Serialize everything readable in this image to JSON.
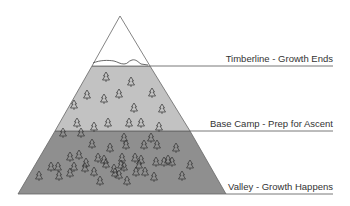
{
  "diagram": {
    "type": "mountain-zones",
    "colors": {
      "peak": "#ffffff",
      "upper_zone": "#c2c2c2",
      "lower_zone": "#8f8f8f",
      "outline": "#555555",
      "tree_stroke": "#333333"
    },
    "zones": [
      {
        "id": "peak",
        "label": ""
      },
      {
        "id": "timberline",
        "label": "Timberline - Growth Ends"
      },
      {
        "id": "base-camp",
        "label": "Base Camp - Prep for Ascent"
      },
      {
        "id": "valley",
        "label": "Valley - Growth Happens"
      }
    ],
    "tree_icon": "tree-icon"
  }
}
